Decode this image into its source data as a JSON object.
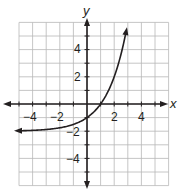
{
  "chart_data": {
    "type": "line",
    "title": "",
    "xlabel": "x",
    "ylabel": "y",
    "xlim": [
      -5,
      6
    ],
    "ylim": [
      -6,
      6
    ],
    "grid": true,
    "x_ticks": [
      -4,
      -2,
      2,
      4
    ],
    "y_ticks": [
      4,
      2,
      -2,
      -4
    ],
    "x_tick_labels": [
      "−4",
      "−2",
      "2",
      "4"
    ],
    "y_tick_labels": [
      "4",
      "2",
      "−2",
      "−4"
    ],
    "series": [
      {
        "name": "y = 2^x - 2",
        "function": "2^x - 2",
        "asymptote_y": -2,
        "y_intercept": -1,
        "x_intercept": 1,
        "x": [
          -5,
          -4,
          -3,
          -2,
          -1,
          0,
          1,
          2,
          2.9
        ],
        "y": [
          -1.97,
          -1.94,
          -1.88,
          -1.75,
          -1.5,
          -1,
          0,
          2,
          5.46
        ],
        "arrows": [
          "left",
          "up"
        ]
      }
    ]
  },
  "labels": {
    "x_axis": "x",
    "y_axis": "y",
    "x_ticks": [
      "−4",
      "−2",
      "2",
      "4"
    ],
    "y_ticks": [
      "4",
      "2",
      "−2",
      "−4"
    ]
  },
  "colors": {
    "grid": "#b8b8b8",
    "axis": "#231f20",
    "curve": "#231f20"
  }
}
